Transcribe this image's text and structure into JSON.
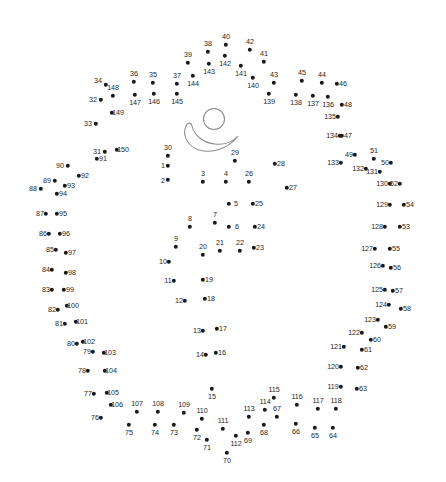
{
  "page": {
    "width": 446,
    "height": 482,
    "background_color": "#ffffff",
    "dot_color": "#1a1a1a",
    "label_color": "#262626",
    "figure_stroke_color": "#8a8a8a"
  },
  "figure": {
    "head": {
      "cx": 214,
      "cy": 119,
      "r": 10.5
    },
    "bowl_path": "M 186 126 C 182 135, 187 146, 199 150 C 213 154, 229 148, 238 136 C 233 142, 224 145, 215 144 C 203 143, 194 135, 192 126 C 191 122, 188 122, 186 126 Z"
  },
  "dots": [
    {
      "n": 1,
      "x": 168,
      "y": 166,
      "lx": 163,
      "ly": 166
    },
    {
      "n": 2,
      "x": 168,
      "y": 180,
      "lx": 163,
      "ly": 181
    },
    {
      "n": 3,
      "x": 203,
      "y": 182,
      "lx": 203,
      "ly": 174
    },
    {
      "n": 4,
      "x": 226,
      "y": 182,
      "lx": 226,
      "ly": 174
    },
    {
      "n": 5,
      "x": 229,
      "y": 204,
      "lx": 236,
      "ly": 204
    },
    {
      "n": 6,
      "x": 229,
      "y": 227,
      "lx": 237,
      "ly": 227
    },
    {
      "n": 7,
      "x": 215,
      "y": 223,
      "lx": 215,
      "ly": 215
    },
    {
      "n": 8,
      "x": 190,
      "y": 227,
      "lx": 190,
      "ly": 219
    },
    {
      "n": 9,
      "x": 176,
      "y": 247,
      "lx": 176,
      "ly": 239
    },
    {
      "n": 10,
      "x": 169,
      "y": 262,
      "lx": 163,
      "ly": 262
    },
    {
      "n": 11,
      "x": 174,
      "y": 281,
      "lx": 168,
      "ly": 281
    },
    {
      "n": 12,
      "x": 185,
      "y": 301,
      "lx": 179,
      "ly": 301
    },
    {
      "n": 13,
      "x": 203,
      "y": 331,
      "lx": 197,
      "ly": 331
    },
    {
      "n": 14,
      "x": 206,
      "y": 355,
      "lx": 200,
      "ly": 355
    },
    {
      "n": 15,
      "x": 212,
      "y": 389,
      "lx": 212,
      "ly": 397
    },
    {
      "n": 16,
      "x": 216,
      "y": 353,
      "lx": 222,
      "ly": 353
    },
    {
      "n": 17,
      "x": 217,
      "y": 329,
      "lx": 223,
      "ly": 329
    },
    {
      "n": 18,
      "x": 205,
      "y": 299,
      "lx": 211,
      "ly": 299
    },
    {
      "n": 19,
      "x": 203,
      "y": 280,
      "lx": 209,
      "ly": 280
    },
    {
      "n": 20,
      "x": 203,
      "y": 255,
      "lx": 203,
      "ly": 247
    },
    {
      "n": 21,
      "x": 220,
      "y": 251,
      "lx": 220,
      "ly": 243
    },
    {
      "n": 22,
      "x": 240,
      "y": 251,
      "lx": 240,
      "ly": 243
    },
    {
      "n": 23,
      "x": 254,
      "y": 248,
      "lx": 260,
      "ly": 248
    },
    {
      "n": 24,
      "x": 255,
      "y": 227,
      "lx": 261,
      "ly": 227
    },
    {
      "n": 25,
      "x": 253,
      "y": 204,
      "lx": 259,
      "ly": 204
    },
    {
      "n": 26,
      "x": 249,
      "y": 182,
      "lx": 249,
      "ly": 174
    },
    {
      "n": 27,
      "x": 287,
      "y": 188,
      "lx": 293,
      "ly": 188
    },
    {
      "n": 28,
      "x": 275,
      "y": 164,
      "lx": 281,
      "ly": 164
    },
    {
      "n": 29,
      "x": 235,
      "y": 161,
      "lx": 235,
      "ly": 153
    },
    {
      "n": 30,
      "x": 168,
      "y": 156,
      "lx": 168,
      "ly": 148
    },
    {
      "n": 31,
      "x": 105,
      "y": 152,
      "lx": 97,
      "ly": 152
    },
    {
      "n": 32,
      "x": 101,
      "y": 100,
      "lx": 93,
      "ly": 100
    },
    {
      "n": 33,
      "x": 96,
      "y": 124,
      "lx": 88,
      "ly": 124
    },
    {
      "n": 34,
      "x": 106,
      "y": 85,
      "lx": 98,
      "ly": 81
    },
    {
      "n": 35,
      "x": 153,
      "y": 83,
      "lx": 153,
      "ly": 75
    },
    {
      "n": 36,
      "x": 134,
      "y": 82,
      "lx": 134,
      "ly": 74
    },
    {
      "n": 37,
      "x": 177,
      "y": 84,
      "lx": 177,
      "ly": 76
    },
    {
      "n": 38,
      "x": 208,
      "y": 52,
      "lx": 208,
      "ly": 44
    },
    {
      "n": 39,
      "x": 188,
      "y": 63,
      "lx": 188,
      "ly": 55
    },
    {
      "n": 40,
      "x": 226,
      "y": 45,
      "lx": 226,
      "ly": 37
    },
    {
      "n": 41,
      "x": 264,
      "y": 62,
      "lx": 264,
      "ly": 54
    },
    {
      "n": 42,
      "x": 250,
      "y": 50,
      "lx": 250,
      "ly": 42
    },
    {
      "n": 43,
      "x": 274,
      "y": 83,
      "lx": 274,
      "ly": 75
    },
    {
      "n": 44,
      "x": 322,
      "y": 83,
      "lx": 322,
      "ly": 75
    },
    {
      "n": 45,
      "x": 302,
      "y": 81,
      "lx": 302,
      "ly": 73
    },
    {
      "n": 46,
      "x": 337,
      "y": 84,
      "lx": 343,
      "ly": 84
    },
    {
      "n": 47,
      "x": 342,
      "y": 136,
      "lx": 348,
      "ly": 136
    },
    {
      "n": 48,
      "x": 342,
      "y": 105,
      "lx": 348,
      "ly": 105
    },
    {
      "n": 49,
      "x": 355,
      "y": 155,
      "lx": 349,
      "ly": 155
    },
    {
      "n": 50,
      "x": 391,
      "y": 163,
      "lx": 385,
      "ly": 163
    },
    {
      "n": 51,
      "x": 374,
      "y": 159,
      "lx": 374,
      "ly": 151
    },
    {
      "n": 52,
      "x": 400,
      "y": 184,
      "lx": 394,
      "ly": 184
    },
    {
      "n": 53,
      "x": 400,
      "y": 227,
      "lx": 406,
      "ly": 227
    },
    {
      "n": 54,
      "x": 404,
      "y": 205,
      "lx": 410,
      "ly": 205
    },
    {
      "n": 55,
      "x": 390,
      "y": 249,
      "lx": 396,
      "ly": 249
    },
    {
      "n": 56,
      "x": 391,
      "y": 268,
      "lx": 397,
      "ly": 268
    },
    {
      "n": 57,
      "x": 393,
      "y": 291,
      "lx": 399,
      "ly": 291
    },
    {
      "n": 58,
      "x": 401,
      "y": 309,
      "lx": 407,
      "ly": 309
    },
    {
      "n": 59,
      "x": 386,
      "y": 327,
      "lx": 392,
      "ly": 327
    },
    {
      "n": 60,
      "x": 371,
      "y": 340,
      "lx": 377,
      "ly": 340
    },
    {
      "n": 61,
      "x": 362,
      "y": 350,
      "lx": 368,
      "ly": 350
    },
    {
      "n": 62,
      "x": 358,
      "y": 368,
      "lx": 364,
      "ly": 368
    },
    {
      "n": 63,
      "x": 357,
      "y": 389,
      "lx": 363,
      "ly": 389
    },
    {
      "n": 64,
      "x": 333,
      "y": 428,
      "lx": 333,
      "ly": 436
    },
    {
      "n": 65,
      "x": 315,
      "y": 428,
      "lx": 315,
      "ly": 436
    },
    {
      "n": 66,
      "x": 296,
      "y": 424,
      "lx": 296,
      "ly": 432
    },
    {
      "n": 67,
      "x": 277,
      "y": 417,
      "lx": 277,
      "ly": 409
    },
    {
      "n": 68,
      "x": 264,
      "y": 425,
      "lx": 264,
      "ly": 433
    },
    {
      "n": 69,
      "x": 248,
      "y": 433,
      "lx": 248,
      "ly": 441
    },
    {
      "n": 70,
      "x": 227,
      "y": 453,
      "lx": 227,
      "ly": 461
    },
    {
      "n": 71,
      "x": 207,
      "y": 440,
      "lx": 207,
      "ly": 448
    },
    {
      "n": 72,
      "x": 197,
      "y": 430,
      "lx": 197,
      "ly": 438
    },
    {
      "n": 73,
      "x": 174,
      "y": 425,
      "lx": 174,
      "ly": 433
    },
    {
      "n": 74,
      "x": 155,
      "y": 425,
      "lx": 155,
      "ly": 433
    },
    {
      "n": 75,
      "x": 129,
      "y": 425,
      "lx": 129,
      "ly": 433
    },
    {
      "n": 76,
      "x": 101,
      "y": 418,
      "lx": 95,
      "ly": 418
    },
    {
      "n": 77,
      "x": 94,
      "y": 394,
      "lx": 88,
      "ly": 394
    },
    {
      "n": 78,
      "x": 88,
      "y": 371,
      "lx": 82,
      "ly": 371
    },
    {
      "n": 79,
      "x": 93,
      "y": 352,
      "lx": 87,
      "ly": 352
    },
    {
      "n": 80,
      "x": 77,
      "y": 344,
      "lx": 71,
      "ly": 344
    },
    {
      "n": 81,
      "x": 65,
      "y": 324,
      "lx": 59,
      "ly": 324
    },
    {
      "n": 82,
      "x": 58,
      "y": 310,
      "lx": 52,
      "ly": 310
    },
    {
      "n": 83,
      "x": 52,
      "y": 290,
      "lx": 46,
      "ly": 290
    },
    {
      "n": 84,
      "x": 52,
      "y": 270,
      "lx": 46,
      "ly": 270
    },
    {
      "n": 85,
      "x": 56,
      "y": 250,
      "lx": 50,
      "ly": 250
    },
    {
      "n": 86,
      "x": 49,
      "y": 234,
      "lx": 43,
      "ly": 234
    },
    {
      "n": 87,
      "x": 46,
      "y": 214,
      "lx": 40,
      "ly": 214
    },
    {
      "n": 88,
      "x": 41,
      "y": 189,
      "lx": 33,
      "ly": 189
    },
    {
      "n": 89,
      "x": 55,
      "y": 181,
      "lx": 47,
      "ly": 181
    },
    {
      "n": 90,
      "x": 68,
      "y": 166,
      "lx": 60,
      "ly": 166
    },
    {
      "n": 91,
      "x": 97,
      "y": 159,
      "lx": 103,
      "ly": 159
    },
    {
      "n": 92,
      "x": 79,
      "y": 176,
      "lx": 85,
      "ly": 176
    },
    {
      "n": 93,
      "x": 65,
      "y": 186,
      "lx": 71,
      "ly": 186
    },
    {
      "n": 94,
      "x": 57,
      "y": 194,
      "lx": 63,
      "ly": 194
    },
    {
      "n": 95,
      "x": 57,
      "y": 214,
      "lx": 63,
      "ly": 214
    },
    {
      "n": 96,
      "x": 60,
      "y": 234,
      "lx": 66,
      "ly": 234
    },
    {
      "n": 97,
      "x": 66,
      "y": 253,
      "lx": 72,
      "ly": 253
    },
    {
      "n": 98,
      "x": 66,
      "y": 273,
      "lx": 72,
      "ly": 273
    },
    {
      "n": 99,
      "x": 64,
      "y": 290,
      "lx": 70,
      "ly": 290
    },
    {
      "n": 100,
      "x": 67,
      "y": 306,
      "lx": 73,
      "ly": 306
    },
    {
      "n": 101,
      "x": 76,
      "y": 322,
      "lx": 82,
      "ly": 322
    },
    {
      "n": 102,
      "x": 83,
      "y": 342,
      "lx": 89,
      "ly": 342
    },
    {
      "n": 103,
      "x": 104,
      "y": 353,
      "lx": 110,
      "ly": 353
    },
    {
      "n": 104,
      "x": 105,
      "y": 371,
      "lx": 111,
      "ly": 371
    },
    {
      "n": 105,
      "x": 107,
      "y": 393,
      "lx": 113,
      "ly": 393
    },
    {
      "n": 106,
      "x": 111,
      "y": 405,
      "lx": 117,
      "ly": 405
    },
    {
      "n": 107,
      "x": 137,
      "y": 412,
      "lx": 137,
      "ly": 404
    },
    {
      "n": 108,
      "x": 158,
      "y": 412,
      "lx": 158,
      "ly": 404
    },
    {
      "n": 109,
      "x": 184,
      "y": 413,
      "lx": 184,
      "ly": 405
    },
    {
      "n": 110,
      "x": 202,
      "y": 419,
      "lx": 202,
      "ly": 411
    },
    {
      "n": 111,
      "x": 223,
      "y": 429,
      "lx": 223,
      "ly": 421
    },
    {
      "n": 112,
      "x": 236,
      "y": 436,
      "lx": 236,
      "ly": 444
    },
    {
      "n": 113,
      "x": 249,
      "y": 417,
      "lx": 249,
      "ly": 409
    },
    {
      "n": 114,
      "x": 265,
      "y": 410,
      "lx": 265,
      "ly": 402
    },
    {
      "n": 115,
      "x": 274,
      "y": 398,
      "lx": 274,
      "ly": 390
    },
    {
      "n": 116,
      "x": 297,
      "y": 405,
      "lx": 297,
      "ly": 397
    },
    {
      "n": 117,
      "x": 318,
      "y": 409,
      "lx": 318,
      "ly": 401
    },
    {
      "n": 118,
      "x": 336,
      "y": 409,
      "lx": 336,
      "ly": 401
    },
    {
      "n": 119,
      "x": 341,
      "y": 387,
      "lx": 333,
      "ly": 387
    },
    {
      "n": 120,
      "x": 341,
      "y": 367,
      "lx": 333,
      "ly": 367
    },
    {
      "n": 121,
      "x": 344,
      "y": 347,
      "lx": 336,
      "ly": 347
    },
    {
      "n": 122,
      "x": 362,
      "y": 333,
      "lx": 354,
      "ly": 333
    },
    {
      "n": 123,
      "x": 378,
      "y": 320,
      "lx": 370,
      "ly": 320
    },
    {
      "n": 124,
      "x": 389,
      "y": 305,
      "lx": 381,
      "ly": 305
    },
    {
      "n": 125,
      "x": 385,
      "y": 290,
      "lx": 377,
      "ly": 290
    },
    {
      "n": 126,
      "x": 383,
      "y": 266,
      "lx": 375,
      "ly": 266
    },
    {
      "n": 127,
      "x": 375,
      "y": 249,
      "lx": 367,
      "ly": 249
    },
    {
      "n": 128,
      "x": 385,
      "y": 227,
      "lx": 377,
      "ly": 227
    },
    {
      "n": 129,
      "x": 390,
      "y": 205,
      "lx": 382,
      "ly": 205
    },
    {
      "n": 130,
      "x": 390,
      "y": 184,
      "lx": 382,
      "ly": 184
    },
    {
      "n": 131,
      "x": 380,
      "y": 172,
      "lx": 372,
      "ly": 172
    },
    {
      "n": 132,
      "x": 366,
      "y": 169,
      "lx": 358,
      "ly": 169
    },
    {
      "n": 133,
      "x": 341,
      "y": 163,
      "lx": 333,
      "ly": 163
    },
    {
      "n": 134,
      "x": 340,
      "y": 136,
      "lx": 332,
      "ly": 136
    },
    {
      "n": 135,
      "x": 338,
      "y": 117,
      "lx": 330,
      "ly": 117
    },
    {
      "n": 136,
      "x": 328,
      "y": 97,
      "lx": 328,
      "ly": 105
    },
    {
      "n": 137,
      "x": 313,
      "y": 96,
      "lx": 313,
      "ly": 104
    },
    {
      "n": 138,
      "x": 296,
      "y": 95,
      "lx": 296,
      "ly": 103
    },
    {
      "n": 139,
      "x": 269,
      "y": 94,
      "lx": 269,
      "ly": 102
    },
    {
      "n": 140,
      "x": 253,
      "y": 78,
      "lx": 253,
      "ly": 86
    },
    {
      "n": 141,
      "x": 241,
      "y": 66,
      "lx": 241,
      "ly": 74
    },
    {
      "n": 142,
      "x": 225,
      "y": 56,
      "lx": 225,
      "ly": 64
    },
    {
      "n": 143,
      "x": 209,
      "y": 64,
      "lx": 209,
      "ly": 72
    },
    {
      "n": 144,
      "x": 193,
      "y": 76,
      "lx": 193,
      "ly": 84
    },
    {
      "n": 145,
      "x": 177,
      "y": 94,
      "lx": 177,
      "ly": 102
    },
    {
      "n": 146,
      "x": 154,
      "y": 94,
      "lx": 154,
      "ly": 102
    },
    {
      "n": 147,
      "x": 135,
      "y": 95,
      "lx": 135,
      "ly": 103
    },
    {
      "n": 148,
      "x": 113,
      "y": 96,
      "lx": 113,
      "ly": 88
    },
    {
      "n": 149,
      "x": 112,
      "y": 113,
      "lx": 118,
      "ly": 113
    },
    {
      "n": 150,
      "x": 117,
      "y": 150,
      "lx": 123,
      "ly": 150
    }
  ]
}
